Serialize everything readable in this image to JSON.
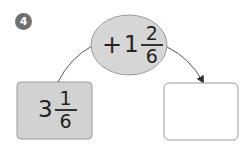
{
  "badge": {
    "number": "4"
  },
  "operation": {
    "operator": "+",
    "whole": "1",
    "numerator": "2",
    "denominator": "6"
  },
  "start_box": {
    "whole": "3",
    "numerator": "1",
    "denominator": "6"
  },
  "answer_box": {
    "value": ""
  },
  "colors": {
    "badge": "#6f6f6f",
    "ellipse_fill": "#d6d6d6",
    "start_box_fill": "#d2d2d2",
    "border": "#9a9a9a",
    "line": "#555555"
  }
}
